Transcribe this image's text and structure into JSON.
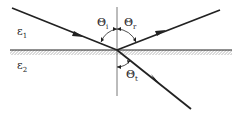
{
  "diagram": {
    "type": "refraction-at-interface",
    "media": [
      {
        "name": "upper-medium",
        "label": "ε",
        "sub": "1"
      },
      {
        "name": "lower-medium",
        "label": "ε",
        "sub": "2"
      }
    ],
    "angles": [
      {
        "name": "incidence",
        "label": "Θ",
        "sub": "i"
      },
      {
        "name": "reflection",
        "label": "Θ",
        "sub": "r"
      },
      {
        "name": "transmission",
        "label": "Θ",
        "sub": "t"
      }
    ],
    "colors": {
      "line": "#222222",
      "normal": "#555555",
      "background": "#ffffff"
    }
  }
}
